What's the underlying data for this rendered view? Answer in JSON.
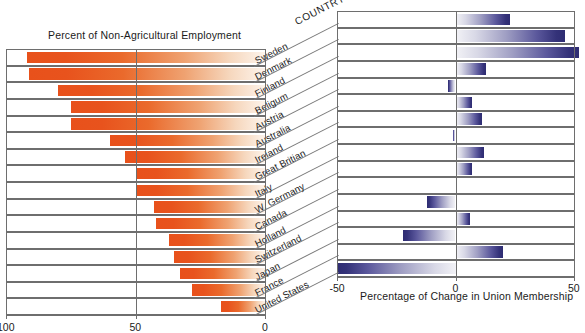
{
  "left_chart": {
    "title": "Percent of Non-Agricultural Employment",
    "ticks": [
      {
        "label": "100",
        "value": 100
      },
      {
        "label": "50",
        "value": 50
      },
      {
        "label": "0",
        "value": 0
      }
    ]
  },
  "right_chart": {
    "title": "Percentage of Change in Union Membership",
    "ticks": [
      {
        "label": "-50",
        "value": -50
      },
      {
        "label": "0",
        "value": 0
      },
      {
        "label": "50",
        "value": 50
      }
    ]
  },
  "country_axis": {
    "header": "COUNTRY",
    "names": [
      "Sweden",
      "Denmark",
      "Finland",
      "Beligum",
      "Austria",
      "Australia",
      "Ireland",
      "Great Britian",
      "Italy",
      "W. Germany",
      "Canada",
      "Holland",
      "Switzerland",
      "Japan",
      "France",
      "United States"
    ]
  },
  "colors": {
    "employment_bar_strong": "#e8511b",
    "employment_bar_fade": "#fdf4ec",
    "union_bar_strong": "#2e2c72",
    "union_bar_fade": "#f2f2f6",
    "rule": "#6e6e6e",
    "text": "#1b1b1b"
  },
  "chart_data": [
    {
      "type": "bar",
      "title": "Percent of Non-Agricultural Employment",
      "orientation": "horizontal",
      "xlabel": "Percent of Non-Agricultural Employment",
      "ylabel": "COUNTRY",
      "xlim": [
        100,
        0
      ],
      "x_axis_reversed": true,
      "xticks": [
        100,
        50,
        0
      ],
      "grid": false,
      "legend": "none",
      "categories": [
        "Sweden",
        "Denmark",
        "Finland",
        "Beligum",
        "Austria",
        "Australia",
        "Ireland",
        "Great Britian",
        "Italy",
        "W. Germany",
        "Canada",
        "Holland",
        "Switzerland",
        "Japan",
        "France",
        "United States"
      ],
      "values": [
        92,
        91,
        80,
        75,
        75,
        60,
        54,
        50,
        50,
        43,
        42,
        37,
        35,
        33,
        28,
        17
      ]
    },
    {
      "type": "bar",
      "title": "Percentage of Change in Union Membership",
      "orientation": "horizontal",
      "xlabel": "Percentage of Change in Union Membership",
      "ylabel": "COUNTRY",
      "xlim": [
        -50,
        50
      ],
      "xticks": [
        -50,
        0,
        50
      ],
      "grid": false,
      "legend": "none",
      "categories": [
        "Sweden",
        "Denmark",
        "Finland",
        "Beligum",
        "Austria",
        "Australia",
        "Ireland",
        "Great Britian",
        "Italy",
        "W. Germany",
        "Canada",
        "Holland",
        "Switzerland",
        "Japan",
        "France",
        "United States"
      ],
      "values": [
        23,
        46,
        52,
        13,
        -3,
        7,
        11,
        -1,
        12,
        7,
        0,
        -12,
        6,
        -22,
        20,
        -50
      ]
    }
  ]
}
